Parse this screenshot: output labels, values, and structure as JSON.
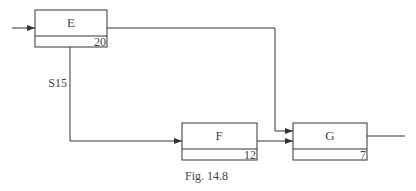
{
  "diagram": {
    "caption": "Fig. 14.8",
    "nodes": [
      {
        "id": "E",
        "label": "E",
        "duration": "20"
      },
      {
        "id": "F",
        "label": "F",
        "duration": "12"
      },
      {
        "id": "G",
        "label": "G",
        "duration": "7"
      }
    ],
    "edges": [
      {
        "from": "input",
        "to": "E",
        "label": ""
      },
      {
        "from": "E",
        "to": "G",
        "label": ""
      },
      {
        "from": "E",
        "to": "F",
        "label": "S15"
      },
      {
        "from": "F",
        "to": "G",
        "label": ""
      },
      {
        "from": "G",
        "to": "output",
        "label": ""
      }
    ]
  }
}
